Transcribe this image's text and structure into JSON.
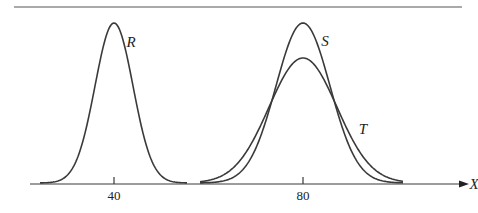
{
  "chart_data": {
    "type": "line",
    "title": "",
    "xlabel": "X",
    "ylabel": "",
    "x_ticks": [
      40,
      80
    ],
    "grid": false,
    "legend": "inline curve labels",
    "series": [
      {
        "name": "R",
        "mean": 40,
        "relative_sd": "small",
        "relative_peak": 1.0,
        "description": "narrow normal curve centered at 40"
      },
      {
        "name": "S",
        "mean": 80,
        "relative_sd": "medium",
        "relative_peak": 1.0,
        "description": "normal curve centered at 80, wider than R"
      },
      {
        "name": "T",
        "mean": 80,
        "relative_sd": "large",
        "relative_peak": 0.79,
        "description": "flatter, wider normal curve centered at 80"
      }
    ]
  },
  "labels": {
    "R": "R",
    "S": "S",
    "T": "T",
    "x_axis": "X",
    "tick_40": "40",
    "tick_80": "80"
  },
  "colors": {
    "curve": "#3a3a3a",
    "background": "#ffffff"
  }
}
